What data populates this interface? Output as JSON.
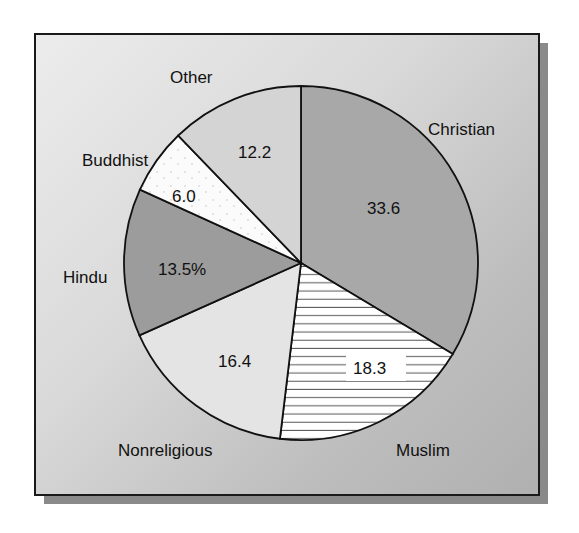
{
  "chart_data": {
    "type": "pie",
    "title": "",
    "unit": "%",
    "start_angle": "12 o'clock",
    "direction": "clockwise",
    "slices": [
      {
        "label": "Christian",
        "value": 33.6,
        "value_text": "33.6",
        "fill": "#a8a8a8",
        "pattern": "fine-texture"
      },
      {
        "label": "Muslim",
        "value": 18.3,
        "value_text": "18.3",
        "fill": "#ffffff",
        "pattern": "horizontal-lines"
      },
      {
        "label": "Nonreligious",
        "value": 16.4,
        "value_text": "16.4",
        "fill": "#e4e4e4",
        "pattern": "light-texture"
      },
      {
        "label": "Hindu",
        "value": 13.5,
        "value_text": "13.5%",
        "fill": "#9c9c9c",
        "pattern": "fine-texture"
      },
      {
        "label": "Buddhist",
        "value": 6.0,
        "value_text": "6.0",
        "fill": "#fbfbfb",
        "pattern": "dots"
      },
      {
        "label": "Other",
        "value": 12.2,
        "value_text": "12.2",
        "fill": "#d4d4d4",
        "pattern": "light-texture"
      }
    ],
    "legend": "none (labels placed outside slices)"
  },
  "labels": {
    "christian": "Christian",
    "muslim": "Muslim",
    "nonreligious": "Nonreligious",
    "hindu": "Hindu",
    "buddhist": "Buddhist",
    "other": "Other"
  },
  "values": {
    "christian": "33.6",
    "muslim": "18.3",
    "nonreligious": "16.4",
    "hindu": "13.5%",
    "buddhist": "6.0",
    "other": "12.2"
  }
}
